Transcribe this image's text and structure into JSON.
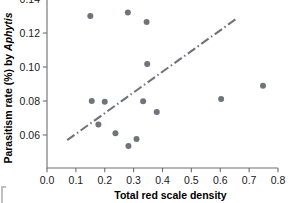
{
  "chart_data": {
    "type": "scatter",
    "title": "",
    "xlabel": "Total red scale density",
    "ylabel_plain": "Parasitism rate (%) by ",
    "ylabel_italic": "Aphytis",
    "xlim": [
      0.0,
      0.8
    ],
    "ylim": [
      0.047,
      0.141
    ],
    "grid": false,
    "legend": null,
    "x_ticks": [
      0.0,
      0.1,
      0.2,
      0.3,
      0.4,
      0.5,
      0.6,
      0.7,
      0.8
    ],
    "x_tick_labels": [
      "0.0",
      "0.1",
      "0.2",
      "0.3",
      "0.4",
      "0.5",
      "0.6",
      "0.7",
      "0.8"
    ],
    "y_ticks": [
      0.06,
      0.08,
      0.1,
      0.12,
      0.14
    ],
    "y_tick_labels": [
      "0.06",
      "0.08",
      "0.10",
      "0.12",
      "0.14"
    ],
    "point_color": "#70737a",
    "line_color": "#70737a",
    "axis_color": "#6e6e6e",
    "points": [
      {
        "x": 0.15,
        "y": 0.13
      },
      {
        "x": 0.155,
        "y": 0.08
      },
      {
        "x": 0.178,
        "y": 0.0662
      },
      {
        "x": 0.2,
        "y": 0.0795
      },
      {
        "x": 0.237,
        "y": 0.061
      },
      {
        "x": 0.28,
        "y": 0.132
      },
      {
        "x": 0.282,
        "y": 0.0535
      },
      {
        "x": 0.31,
        "y": 0.0577
      },
      {
        "x": 0.333,
        "y": 0.0798
      },
      {
        "x": 0.345,
        "y": 0.1265
      },
      {
        "x": 0.347,
        "y": 0.1018
      },
      {
        "x": 0.38,
        "y": 0.0735
      },
      {
        "x": 0.603,
        "y": 0.0812
      },
      {
        "x": 0.748,
        "y": 0.089
      }
    ],
    "trend_line": {
      "style": "dash-dot",
      "x_start": 0.07,
      "y_start": 0.057,
      "x_end": 0.655,
      "y_end": 0.1283
    }
  }
}
